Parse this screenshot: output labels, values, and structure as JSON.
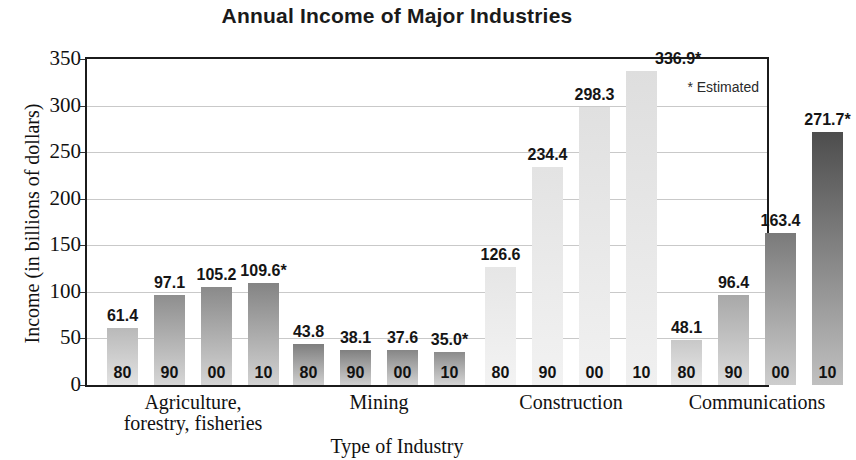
{
  "chart_data": {
    "type": "bar",
    "title": "Annual Income of Major Industries",
    "xlabel": "Type of Industry",
    "ylabel": "Income (in billions of dollars)",
    "ylim": [
      0,
      350
    ],
    "ytick_labels": [
      "350",
      "300",
      "250",
      "200",
      "150",
      "100",
      "50",
      "0"
    ],
    "ytick_values": [
      350,
      300,
      250,
      200,
      150,
      100,
      50,
      0
    ],
    "grid": true,
    "legend_position": "top-right",
    "annotation": "* Estimated",
    "categories": [
      "Agriculture, forestry, fisheries",
      "Mining",
      "Construction",
      "Communications"
    ],
    "series_labels": [
      "80",
      "90",
      "00",
      "10"
    ],
    "groups": [
      {
        "name": "Agriculture,\nforestry, fisheries",
        "line1": "Agriculture,",
        "line2": "forestry, fisheries",
        "bars": [
          {
            "year": "80",
            "value": 61.4,
            "label": "61.4",
            "estimated": false,
            "top_color": "#b9b9b9",
            "bottom_color": "#e2e2e2"
          },
          {
            "year": "90",
            "value": 97.1,
            "label": "97.1",
            "estimated": false,
            "top_color": "#8e8e8e",
            "bottom_color": "#d6d6d6"
          },
          {
            "year": "00",
            "value": 105.2,
            "label": "105.2",
            "estimated": false,
            "top_color": "#8a8a8a",
            "bottom_color": "#d4d4d4"
          },
          {
            "year": "10",
            "value": 109.6,
            "label": "109.6*",
            "estimated": true,
            "top_color": "#848484",
            "bottom_color": "#d2d2d2"
          }
        ]
      },
      {
        "name": "Mining",
        "line1": "Mining",
        "line2": "",
        "bars": [
          {
            "year": "80",
            "value": 43.8,
            "label": "43.8",
            "estimated": false,
            "top_color": "#7e7e7e",
            "bottom_color": "#cfcfcf"
          },
          {
            "year": "90",
            "value": 38.1,
            "label": "38.1",
            "estimated": false,
            "top_color": "#808080",
            "bottom_color": "#d0d0d0"
          },
          {
            "year": "00",
            "value": 37.6,
            "label": "37.6",
            "estimated": false,
            "top_color": "#868686",
            "bottom_color": "#d2d2d2"
          },
          {
            "year": "10",
            "value": 35.0,
            "label": "35.0*",
            "estimated": true,
            "top_color": "#8b8b8b",
            "bottom_color": "#d4d4d4"
          }
        ]
      },
      {
        "name": "Construction",
        "line1": "Construction",
        "line2": "",
        "bars": [
          {
            "year": "80",
            "value": 126.6,
            "label": "126.6",
            "estimated": false,
            "top_color": "#e6e6e6",
            "bottom_color": "#f3f3f3"
          },
          {
            "year": "90",
            "value": 234.4,
            "label": "234.4",
            "estimated": false,
            "top_color": "#e3e3e3",
            "bottom_color": "#f2f2f2"
          },
          {
            "year": "00",
            "value": 298.3,
            "label": "298.3",
            "estimated": false,
            "top_color": "#e0e0e0",
            "bottom_color": "#f1f1f1"
          },
          {
            "year": "10",
            "value": 336.9,
            "label": "336.9*",
            "estimated": true,
            "top_color": "#dedede",
            "bottom_color": "#f0f0f0"
          }
        ]
      },
      {
        "name": "Communications",
        "line1": "Communications",
        "line2": "",
        "bars": [
          {
            "year": "80",
            "value": 48.1,
            "label": "48.1",
            "estimated": false,
            "top_color": "#c8c8c8",
            "bottom_color": "#e8e8e8"
          },
          {
            "year": "90",
            "value": 96.4,
            "label": "96.4",
            "estimated": false,
            "top_color": "#a8a8a8",
            "bottom_color": "#dddddd"
          },
          {
            "year": "00",
            "value": 163.4,
            "label": "163.4",
            "estimated": false,
            "top_color": "#7a7a7a",
            "bottom_color": "#cdcdcd"
          },
          {
            "year": "10",
            "value": 271.7,
            "label": "271.7*",
            "estimated": true,
            "top_color": "#4d4d4d",
            "bottom_color": "#c0c0c0"
          }
        ]
      }
    ]
  },
  "colors": {
    "axis": "#1b1b1b",
    "grid": "#c9c9c9",
    "text": "#111111"
  }
}
